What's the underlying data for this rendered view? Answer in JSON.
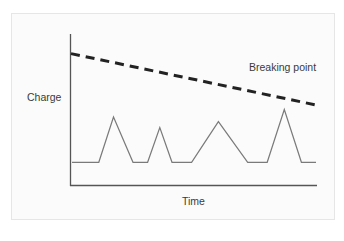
{
  "chart_data": {
    "type": "line",
    "title": "",
    "xlabel": "Time",
    "ylabel": "Charge",
    "grid": false,
    "legend": null,
    "annotations": [
      {
        "text": "Breaking point",
        "target_series": "Breaking point",
        "position": "above right end of dashed line"
      }
    ],
    "series": [
      {
        "name": "Breaking point",
        "style": "dashed",
        "color": "#222222",
        "description": "Declining threshold line from upper left to lower right",
        "points": [
          [
            0,
            0.87
          ],
          [
            1,
            0.53
          ]
        ]
      },
      {
        "name": "Charge",
        "style": "solid",
        "color": "#7a7a7a",
        "description": "Baseline with four triangular spikes; last spike nearly reaches the breaking point",
        "points": [
          [
            0.0,
            0.15
          ],
          [
            0.11,
            0.15
          ],
          [
            0.17,
            0.45
          ],
          [
            0.25,
            0.15
          ],
          [
            0.31,
            0.15
          ],
          [
            0.36,
            0.38
          ],
          [
            0.41,
            0.15
          ],
          [
            0.49,
            0.15
          ],
          [
            0.6,
            0.42
          ],
          [
            0.72,
            0.15
          ],
          [
            0.8,
            0.15
          ],
          [
            0.87,
            0.5
          ],
          [
            0.94,
            0.15
          ],
          [
            1.0,
            0.15
          ]
        ]
      }
    ],
    "xlim": [
      0,
      1
    ],
    "ylim": [
      0,
      1
    ],
    "ticks": {
      "x": [],
      "y": []
    }
  },
  "labels": {
    "y_axis": "Charge",
    "x_axis": "Time",
    "breaking_point": "Breaking point"
  },
  "colors": {
    "axis": "#555555",
    "dashed_line": "#222222",
    "charge_line": "#7a7a7a",
    "text": "#3a3a3a",
    "frame_border": "#e6e6e6"
  }
}
